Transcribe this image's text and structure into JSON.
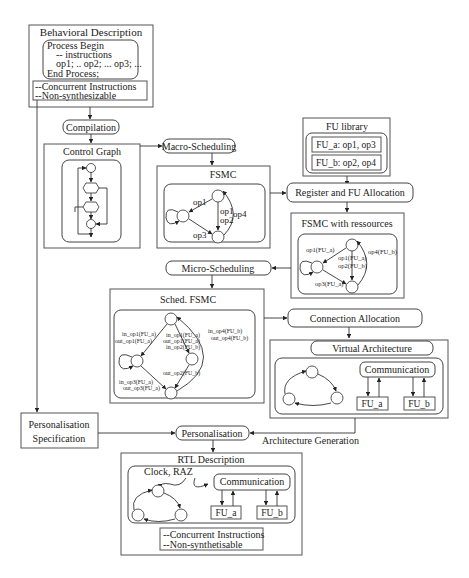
{
  "behavioral": {
    "title": "Behavioral Description",
    "code": [
      "Process Begin",
      "-- instructions",
      "op1; .. op2; ... op3; ...",
      "End Process;"
    ],
    "notes": [
      "--Concurrent Instructions",
      "--Non-synthesizable"
    ]
  },
  "steps": {
    "compilation": "Compilation",
    "macro_scheduling": "Macro-Scheduling",
    "register_fu_allocation": "Register and FU Allocation",
    "micro_scheduling": "Micro-Scheduling",
    "connection_allocation": "Connection Allocation",
    "personalisation": "Personalisation",
    "architecture_generation": "Architecture Generation"
  },
  "control_graph": {
    "title": "Control Graph"
  },
  "fu_library": {
    "title": "FU library",
    "entries": [
      "FU_a: op1, op3",
      "FU_b: op2, op4"
    ]
  },
  "fsmc": {
    "title": "FSMC",
    "labels": {
      "op1_left": "op1",
      "op1_mid": "op1",
      "op2_mid": "op2",
      "op3": "op3",
      "op4": "op4"
    }
  },
  "fsmc_resources": {
    "title": "FSMC with ressources",
    "labels": {
      "left": "op1(FU_a)",
      "mid1": "op1(FU_a)",
      "mid2": "op2(FU_b)",
      "right": "op4(FU_b)",
      "bottom": "op3(FU_a)"
    }
  },
  "sched_fsmc": {
    "title": "Sched. FSMC",
    "labels": {
      "left1": "in_op1(FU_a)",
      "left2": "out_op1(FU_a)",
      "mid1": "in_op1(FU_a)",
      "mid2": "out_op1(FU_a)",
      "mid3": "in_op2(FU_b)",
      "right1": "in_op4(FU_b)",
      "right2": "out_op4(FU_b)",
      "lower_mid": "out_op2(FU_b)",
      "bottom1": "in_op3(FU_a)",
      "bottom2": "out_op3(FU_a)"
    }
  },
  "virtual_architecture": {
    "title": "Virtual Architecture",
    "communication": "Communication",
    "fu_a": "FU_a",
    "fu_b": "FU_b"
  },
  "personalisation_spec": {
    "lines": [
      "Personalisation",
      "Specification"
    ]
  },
  "rtl": {
    "title": "RTL Description",
    "signals": "Clock, RAZ",
    "communication": "Communication",
    "fu_a": "FU_a",
    "fu_b": "FU_b",
    "notes": [
      "--Concurrent Instructions",
      "--Non-synthetisable"
    ]
  }
}
